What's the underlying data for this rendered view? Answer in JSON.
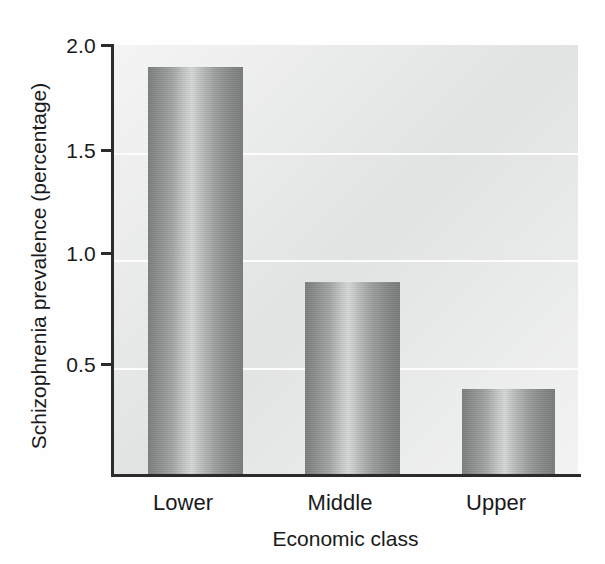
{
  "chart_data": {
    "type": "bar",
    "title": "",
    "subtitle": "",
    "xlabel": "Economic class",
    "ylabel": "Schizophrenia prevalence (percentage)",
    "categories": [
      "Lower",
      "Middle",
      "Upper"
    ],
    "values": [
      1.9,
      0.9,
      0.4
    ],
    "series": [
      {
        "name": "Schizophrenia prevalence",
        "values": [
          1.9,
          0.9,
          0.4
        ]
      }
    ],
    "ylim": [
      0,
      2.0
    ],
    "yticks": [
      "0.5",
      "1.0",
      "1.5",
      "2.0"
    ],
    "ytick_values": [
      0.5,
      1.0,
      1.5,
      2.0
    ],
    "grid": "horizontal",
    "legend": "none",
    "annotations": [],
    "units": "percentage",
    "bar_style": "cylindrical-gradient-grayscale"
  },
  "axes": {
    "y_title": "Schizophrenia prevalence (percentage)",
    "x_title": "Economic class",
    "y_tick_labels": [
      "2.0",
      "1.5",
      "1.0",
      "0.5"
    ],
    "x_tick_labels": [
      "Lower",
      "Middle",
      "Upper"
    ]
  },
  "colors": {
    "plot_background": "#e6e7e7",
    "gridline": "#fdfdfd",
    "axis": "#2b2b2b",
    "text": "#1a1a1a",
    "bar_dark": "#7d7f7f",
    "bar_light": "#d6d8d8"
  }
}
